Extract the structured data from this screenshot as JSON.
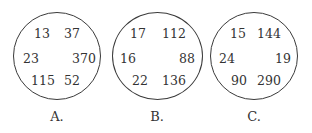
{
  "options": [
    {
      "label": "A.",
      "numbers": {
        "top_left": "13",
        "top_right": "37",
        "mid_left": "23",
        "mid_right": "370",
        "bottom_left": "115",
        "bottom_right": "52"
      }
    },
    {
      "label": "B.",
      "numbers": {
        "top_left": "17",
        "top_right": "112",
        "mid_left": "16",
        "mid_right": "88",
        "bottom_left": "22",
        "bottom_right": "136"
      }
    },
    {
      "label": "C.",
      "numbers": {
        "top_left": "15",
        "top_right": "144",
        "mid_left": "24",
        "mid_right": "19",
        "bottom_left": "90",
        "bottom_right": "290"
      }
    }
  ]
}
